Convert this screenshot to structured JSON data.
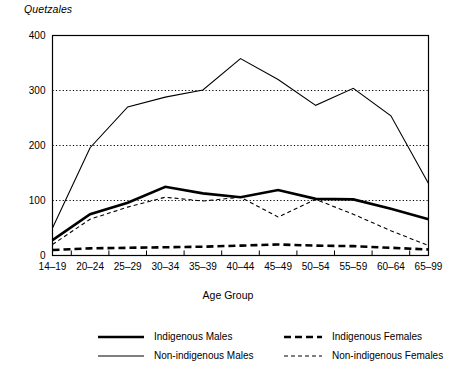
{
  "chart_data": {
    "type": "line",
    "title": "",
    "ylabel": "Quetzales",
    "xlabel": "Age Group",
    "ylim": [
      0,
      400
    ],
    "yticks": [
      0,
      100,
      200,
      300,
      400
    ],
    "grid": "horizontal-dotted",
    "legend_position": "bottom",
    "categories": [
      "14–19",
      "20–24",
      "25–29",
      "30–34",
      "35–39",
      "40–44",
      "45–49",
      "50–54",
      "55–59",
      "60–64",
      "65–99"
    ],
    "series": [
      {
        "name": "Indigenous Males",
        "style": "thick-solid",
        "values": [
          28,
          75,
          96,
          125,
          113,
          106,
          119,
          103,
          102,
          85,
          66
        ]
      },
      {
        "name": "Indigenous Females",
        "style": "thick-dashed",
        "values": [
          10,
          13,
          14,
          15,
          16,
          18,
          20,
          18,
          17,
          14,
          11
        ]
      },
      {
        "name": "Non-indigenous Males",
        "style": "thin-solid",
        "values": [
          50,
          196,
          270,
          288,
          301,
          358,
          320,
          273,
          304,
          254,
          131
        ]
      },
      {
        "name": "Non-indigenous Females",
        "style": "thin-dashed",
        "values": [
          20,
          66,
          88,
          106,
          99,
          106,
          70,
          102,
          75,
          45,
          18
        ]
      }
    ]
  },
  "legend": {
    "items": [
      {
        "label": "Indigenous Males",
        "style": "thick-solid"
      },
      {
        "label": "Indigenous Females",
        "style": "thick-dashed"
      },
      {
        "label": "Non-indigenous Males",
        "style": "thin-solid"
      },
      {
        "label": "Non-indigenous Females",
        "style": "thin-dashed"
      }
    ]
  },
  "colors": {
    "line": "#000000",
    "axis": "#000000",
    "grid": "#000000",
    "background": "#ffffff"
  }
}
